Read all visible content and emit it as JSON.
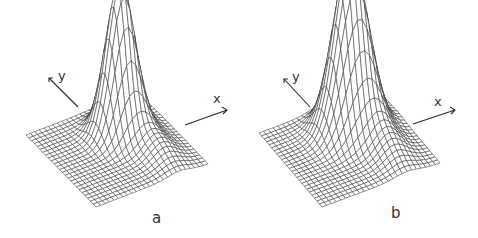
{
  "chart_data": [
    {
      "type": "surface",
      "panel_label": "a",
      "title": "",
      "xlabel": "x",
      "ylabel": "y",
      "description": "Wireframe 3D surface of a single localized peak (Gaussian-like) on a flat square grid",
      "grid_lines_per_axis": 26,
      "peak": {
        "x": 0.62,
        "y": 0.65,
        "height": 1.0,
        "width": 0.11,
        "skew_tail": 0.35
      },
      "grid": false,
      "legend": "none"
    },
    {
      "type": "surface",
      "panel_label": "b",
      "title": "",
      "xlabel": "x",
      "ylabel": "y",
      "description": "Wireframe 3D surface of a single localized peak, slightly broader and taller than panel a",
      "grid_lines_per_axis": 26,
      "peak": {
        "x": 0.6,
        "y": 0.68,
        "height": 1.12,
        "width": 0.13,
        "skew_tail": 0.4
      },
      "grid": false,
      "legend": "none"
    }
  ]
}
